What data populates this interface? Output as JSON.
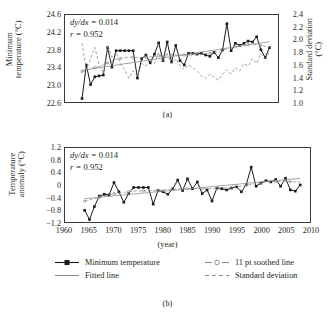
{
  "figure": {
    "panel_a_caption": "(a)",
    "panel_b_caption": "(b)",
    "xaxis_title": "(year)"
  },
  "panel_a": {
    "ytitle": "Minimum temperature (°C)",
    "ytitle_line1": "Minimum",
    "ytitle_line2": "temperature (°C)",
    "right_title_line1": "Standard deviation",
    "right_title_line2": "(°C)",
    "annotation_slope": "dy/dx = 0.014",
    "annotation_slope_label": "dy/dx = ",
    "annotation_slope_value": "0.014",
    "annotation_r_label": "r = ",
    "annotation_r_value": "0.952",
    "yticks": [
      "24.6",
      "24.2",
      "23.8",
      "23.4",
      "23.0",
      "22.6"
    ],
    "right_ticks": [
      "2.4",
      "2.2",
      "2.0",
      "1.8",
      "1.6",
      "1.4",
      "1.2",
      "1.0"
    ]
  },
  "panel_b": {
    "ytitle_line1": "Temperature",
    "ytitle_line2": "anomaly (°C)",
    "annotation_slope_label": "dy/dx = ",
    "annotation_slope_value": "0.014",
    "annotation_r_label": "r = ",
    "annotation_r_value": "0.952",
    "yticks": [
      "1.2",
      "0.8",
      "0.4",
      "0",
      "−0.4",
      "−0.8",
      "−1.2"
    ],
    "xticks": [
      "1960",
      "1965",
      "1970",
      "1975",
      "1980",
      "1985",
      "1990",
      "1995",
      "2000",
      "2005",
      "2010"
    ]
  },
  "legend": {
    "items": [
      {
        "label": "Minimum temperature",
        "key": "solid-square-marker"
      },
      {
        "label": "Fitted line",
        "key": "solid-line"
      },
      {
        "label": "11 pt soothed line",
        "key": "dashed-circle-marker"
      },
      {
        "label": "Standard deviation",
        "key": "dashed-line"
      }
    ]
  },
  "colors": {
    "line": "#1a1a1a",
    "fitted": "#8d8d8d",
    "smoothed": "#8d8d8d",
    "stdev": "#8d8d8d",
    "axis": "#3a3a3a"
  },
  "chart_data": [
    {
      "type": "line",
      "panel": "a",
      "title": "",
      "xlabel": "(year)",
      "ylabel": "Minimum temperature (°C)",
      "y2label": "Standard deviation (°C)",
      "xlim": [
        1960,
        2010
      ],
      "ylim": [
        22.6,
        24.6
      ],
      "y2lim": [
        1.0,
        2.4
      ],
      "grid": false,
      "legend_position": "below-figure",
      "annotations": [
        "dy/dx = 0.014",
        "r = 0.952"
      ],
      "x": [
        1964,
        1965,
        1966,
        1967,
        1968,
        1969,
        1970,
        1971,
        1972,
        1973,
        1974,
        1975,
        1976,
        1977,
        1978,
        1979,
        1980,
        1981,
        1982,
        1983,
        1984,
        1985,
        1986,
        1987,
        1988,
        1989,
        1990,
        1991,
        1992,
        1993,
        1994,
        1995,
        1996,
        1997,
        1998,
        1999,
        2000,
        2001,
        2002,
        2003,
        2004,
        2005,
        2006,
        2007,
        2008
      ],
      "series": [
        {
          "name": "Minimum temperature",
          "axis": "left",
          "values": [
            22.68,
            23.45,
            23.0,
            23.18,
            23.2,
            23.22,
            23.85,
            23.4,
            23.78,
            23.78,
            23.78,
            23.78,
            23.78,
            23.15,
            23.6,
            23.68,
            23.5,
            23.7,
            23.96,
            23.55,
            23.98,
            23.52,
            23.9,
            23.55,
            23.45,
            23.72,
            23.72,
            23.7,
            23.72,
            23.68,
            23.65,
            23.74,
            23.62,
            23.8,
            24.4,
            23.78,
            23.95,
            23.9,
            23.95,
            24.0,
            23.98,
            24.1,
            23.8,
            23.62,
            23.85
          ]
        },
        {
          "name": "Fitted line",
          "axis": "left",
          "values": [
            23.33,
            23.34,
            23.36,
            23.37,
            23.39,
            23.4,
            23.42,
            23.43,
            23.45,
            23.46,
            23.48,
            23.49,
            23.51,
            23.52,
            23.54,
            23.55,
            23.57,
            23.58,
            23.6,
            23.61,
            23.63,
            23.64,
            23.66,
            23.67,
            23.69,
            23.7,
            23.72,
            23.73,
            23.75,
            23.76,
            23.78,
            23.79,
            23.81,
            23.82,
            23.84,
            23.85,
            23.87,
            23.88,
            23.9,
            23.91,
            23.93,
            23.94,
            23.96,
            23.97,
            23.99
          ]
        },
        {
          "name": "11 pt soothed line",
          "axis": "left",
          "values": [
            23.3,
            23.33,
            23.36,
            23.39,
            23.42,
            23.45,
            23.5,
            23.54,
            23.58,
            23.6,
            23.62,
            23.63,
            23.63,
            23.62,
            23.62,
            23.63,
            23.64,
            23.65,
            23.66,
            23.67,
            23.68,
            23.68,
            23.68,
            23.68,
            23.68,
            23.68,
            23.68,
            23.69,
            23.7,
            23.71,
            23.72,
            23.74,
            23.76,
            23.79,
            23.82,
            23.85,
            23.88,
            23.9,
            23.91,
            23.92,
            23.92,
            23.92,
            23.9,
            23.88,
            23.86
          ]
        },
        {
          "name": "Standard deviation",
          "axis": "right",
          "values": [
            1.95,
            1.52,
            1.7,
            1.88,
            1.6,
            1.45,
            1.92,
            1.72,
            1.8,
            1.62,
            1.52,
            1.38,
            1.5,
            1.42,
            1.62,
            1.58,
            1.7,
            1.62,
            1.8,
            1.66,
            1.78,
            1.62,
            1.7,
            1.58,
            1.52,
            1.6,
            1.55,
            1.5,
            1.42,
            1.38,
            1.45,
            1.4,
            1.35,
            1.45,
            1.52,
            1.45,
            1.55,
            1.5,
            1.62,
            1.58,
            1.7,
            1.62,
            1.78,
            1.7,
            1.8
          ]
        }
      ]
    },
    {
      "type": "line",
      "panel": "b",
      "title": "",
      "xlabel": "(year)",
      "ylabel": "Temperature anomaly (°C)",
      "xlim": [
        1960,
        2010
      ],
      "ylim": [
        -1.2,
        1.2
      ],
      "grid": false,
      "legend_position": "below-figure",
      "annotations": [
        "dy/dx = 0.014",
        "r = 0.952"
      ],
      "x": [
        1964,
        1965,
        1966,
        1967,
        1968,
        1969,
        1970,
        1971,
        1972,
        1973,
        1974,
        1975,
        1976,
        1977,
        1978,
        1979,
        1980,
        1981,
        1982,
        1983,
        1984,
        1985,
        1986,
        1987,
        1988,
        1989,
        1990,
        1991,
        1992,
        1993,
        1994,
        1995,
        1996,
        1997,
        1998,
        1999,
        2000,
        2001,
        2002,
        2003,
        2004,
        2005,
        2006,
        2007,
        2008
      ],
      "series": [
        {
          "name": "Temperature anomaly",
          "values": [
            -0.82,
            -1.12,
            -0.7,
            -0.36,
            -0.3,
            -0.32,
            0.08,
            -0.22,
            -0.56,
            -0.28,
            -0.08,
            -0.08,
            -0.08,
            -0.08,
            -0.62,
            -0.18,
            -0.22,
            -0.3,
            -0.12,
            0.16,
            -0.18,
            0.2,
            -0.12,
            0.1,
            -0.28,
            -0.16,
            -0.52,
            -0.1,
            -0.12,
            -0.16,
            -0.1,
            -0.06,
            -0.22,
            0.02,
            0.58,
            -0.04,
            0.06,
            0.14,
            0.1,
            0.18,
            -0.04,
            0.22,
            -0.16,
            -0.2,
            0.0
          ]
        },
        {
          "name": "Fitted line",
          "values": [
            -0.44,
            -0.43,
            -0.41,
            -0.4,
            -0.38,
            -0.37,
            -0.35,
            -0.34,
            -0.32,
            -0.31,
            -0.29,
            -0.28,
            -0.26,
            -0.25,
            -0.23,
            -0.22,
            -0.2,
            -0.19,
            -0.17,
            -0.16,
            -0.14,
            -0.13,
            -0.11,
            -0.1,
            -0.08,
            -0.07,
            -0.05,
            -0.04,
            -0.02,
            -0.01,
            0.01,
            0.02,
            0.04,
            0.05,
            0.07,
            0.08,
            0.1,
            0.11,
            0.13,
            0.14,
            0.16,
            0.17,
            0.19,
            0.2,
            0.22
          ]
        },
        {
          "name": "11 pt soothed line",
          "values": [
            -0.52,
            -0.48,
            -0.44,
            -0.4,
            -0.36,
            -0.32,
            -0.28,
            -0.26,
            -0.24,
            -0.22,
            -0.2,
            -0.19,
            -0.19,
            -0.19,
            -0.18,
            -0.17,
            -0.16,
            -0.15,
            -0.14,
            -0.13,
            -0.12,
            -0.12,
            -0.12,
            -0.12,
            -0.12,
            -0.12,
            -0.12,
            -0.11,
            -0.1,
            -0.09,
            -0.08,
            -0.06,
            -0.04,
            -0.01,
            0.02,
            0.05,
            0.08,
            0.1,
            0.11,
            0.12,
            0.12,
            0.12,
            0.11,
            0.1,
            0.09
          ]
        }
      ]
    }
  ]
}
